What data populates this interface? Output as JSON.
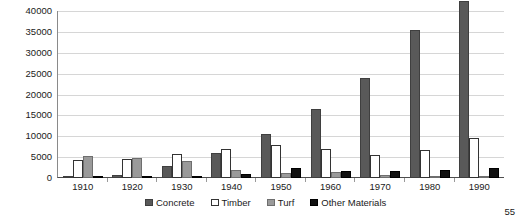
{
  "page": {
    "number": "55"
  },
  "chart_data": {
    "type": "bar",
    "title": "",
    "xlabel": "",
    "ylabel": "",
    "ylim": [
      0,
      40000
    ],
    "ytick_step": 5000,
    "yticks": [
      40000,
      35000,
      30000,
      25000,
      20000,
      15000,
      10000,
      5000,
      0
    ],
    "ytick_labels": [
      "40000",
      "35000",
      "30000",
      "25000",
      "20000",
      "15000",
      "10000",
      "5000",
      "0"
    ],
    "grid": true,
    "legend_position": "bottom",
    "categories": [
      "1910",
      "1920",
      "1930",
      "1940",
      "1950",
      "1960",
      "1970",
      "1980",
      "1990"
    ],
    "series": [
      {
        "name": "Concrete",
        "color": "#595959",
        "values": [
          300,
          800,
          2800,
          6000,
          10500,
          16500,
          24000,
          35500,
          42500
        ]
      },
      {
        "name": "Timber",
        "color": "#ffffff",
        "values": [
          4200,
          4500,
          5800,
          7000,
          8000,
          7000,
          5500,
          6800,
          9500
        ]
      },
      {
        "name": "Turf",
        "color": "#9a9a9a",
        "values": [
          5300,
          4700,
          4000,
          2000,
          1200,
          1500,
          700,
          400,
          300
        ]
      },
      {
        "name": "Other Materials",
        "color": "#111111",
        "values": [
          300,
          300,
          300,
          900,
          2500,
          1700,
          1800,
          1900,
          2400
        ]
      }
    ]
  }
}
